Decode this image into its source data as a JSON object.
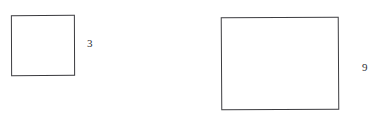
{
  "figure": {
    "background_color": "#ffffff",
    "stroke_color": "#3b3b3f",
    "text_color": "#2e2e33",
    "shapes": [
      {
        "name": "small-square",
        "kind": "square",
        "label": "3",
        "label_position": "right"
      },
      {
        "name": "large-rectangle",
        "kind": "rectangle",
        "label": "9",
        "label_position": "right"
      }
    ]
  }
}
